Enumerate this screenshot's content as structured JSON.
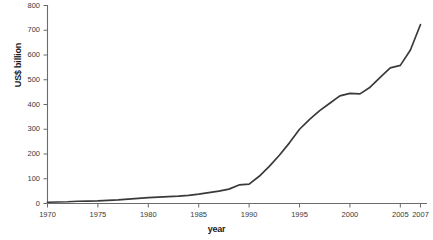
{
  "chart_data": {
    "type": "line",
    "title": "",
    "xlabel": "year",
    "ylabel": "US$ billion",
    "xlim": [
      1970,
      2007
    ],
    "ylim": [
      0,
      800
    ],
    "grid": false,
    "legend": null,
    "y_ticks": [
      0,
      100,
      200,
      300,
      400,
      500,
      600,
      700,
      800
    ],
    "x_ticks": [
      1970,
      1975,
      1980,
      1985,
      1990,
      1995,
      2000,
      2005,
      2007
    ],
    "line_color": "#3a3a3a",
    "x": [
      1970,
      1971,
      1972,
      1973,
      1974,
      1975,
      1976,
      1977,
      1978,
      1979,
      1980,
      1981,
      1982,
      1983,
      1984,
      1985,
      1986,
      1987,
      1988,
      1989,
      1990,
      1991,
      1992,
      1993,
      1994,
      1995,
      1996,
      1997,
      1998,
      1999,
      2000,
      2001,
      2002,
      2003,
      2004,
      2005,
      2006,
      2007
    ],
    "values": [
      5,
      6,
      7,
      9,
      10,
      11,
      13,
      15,
      18,
      21,
      24,
      26,
      28,
      30,
      33,
      38,
      44,
      50,
      58,
      75,
      78,
      110,
      150,
      195,
      245,
      300,
      340,
      375,
      405,
      435,
      445,
      443,
      470,
      510,
      548,
      558,
      620,
      723
    ],
    "series_name": "US$ billion"
  },
  "axis": {
    "ylabel_text": "US$ billion",
    "xlabel_text": "year"
  }
}
